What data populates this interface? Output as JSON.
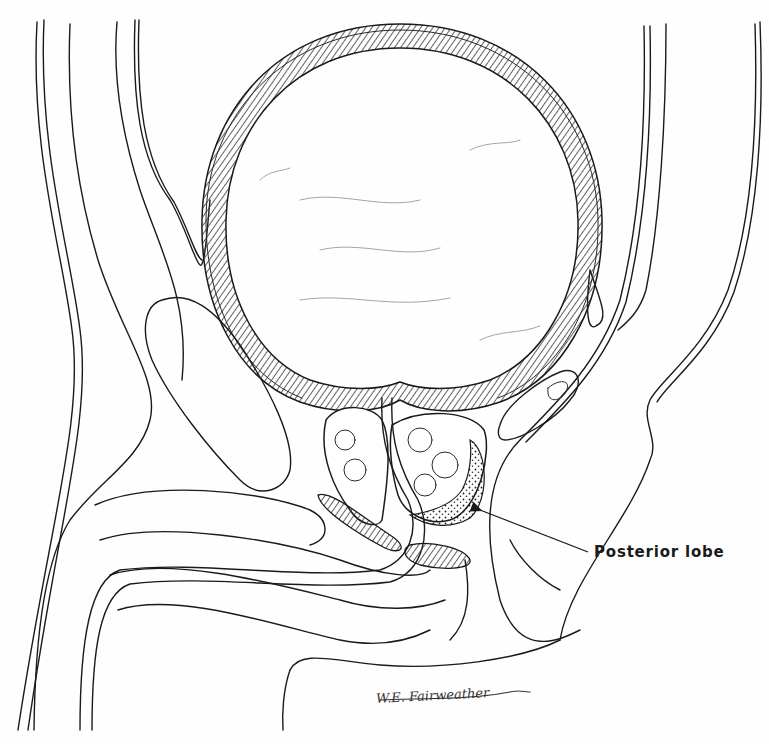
{
  "figure": {
    "type": "anatomical-illustration",
    "labels": [
      {
        "id": "posterior-lobe",
        "text": "Posterior lobe",
        "pointer_target": "dotted posterior region of prostate"
      }
    ],
    "signature": "W.E. Fairweather",
    "colors": {
      "line": "#1a1a1a",
      "background": "#fefefe",
      "hatch": "#3a3a3a"
    }
  }
}
